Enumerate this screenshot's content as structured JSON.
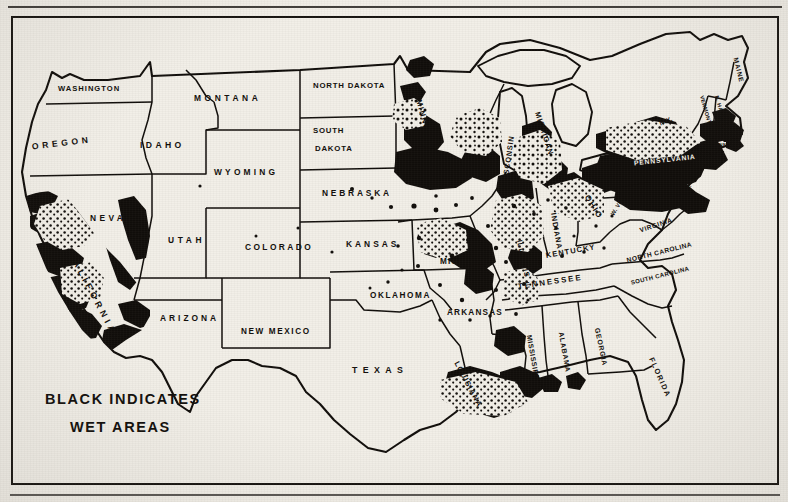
{
  "document": {
    "type": "newspaper-halftone-map",
    "subject": "United States wet areas map",
    "background_color": "#f2efe8",
    "ink_color": "#100d0a"
  },
  "legend": {
    "line1": "BLACK INDICATES",
    "line2": "WET AREAS",
    "meaning": "Black shading marks wet areas"
  },
  "map_data": {
    "type": "choropleth",
    "region": "United States (contiguous 48 states)",
    "shaded_value": "wet",
    "unshaded_value": "dry",
    "shaded_color": "#100d0a",
    "unshaded_color": "#f2efe8",
    "border_color": "#100d0a",
    "states": [
      {
        "name": "WASHINGTON",
        "x": 58,
        "y": 89,
        "size": 7.6,
        "track": 1.0,
        "rot": 0,
        "wet": false
      },
      {
        "name": "OREGON",
        "x": 32,
        "y": 147,
        "size": 8.6,
        "track": 3.6,
        "rot": -7,
        "wet": false
      },
      {
        "name": "IDAHO",
        "x": 140,
        "y": 146,
        "size": 8.6,
        "track": 3.4,
        "rot": 0,
        "wet": false
      },
      {
        "name": "MONTANA",
        "x": 194,
        "y": 98,
        "size": 8.4,
        "track": 3.6,
        "rot": 0,
        "wet": false
      },
      {
        "name": "WYOMING",
        "x": 214,
        "y": 172,
        "size": 8.4,
        "track": 3.2,
        "rot": 0,
        "wet": false
      },
      {
        "name": "NEVADA",
        "x": 90,
        "y": 218,
        "size": 8.4,
        "track": 3.4,
        "rot": 0,
        "wet": true
      },
      {
        "name": "UTAH",
        "x": 168,
        "y": 240,
        "size": 8.4,
        "track": 3.6,
        "rot": 0,
        "wet": false
      },
      {
        "name": "COLORADO",
        "x": 245,
        "y": 247,
        "size": 8.4,
        "track": 2.4,
        "rot": 0,
        "wet": false
      },
      {
        "name": "ARIZONA",
        "x": 160,
        "y": 318,
        "size": 8.4,
        "track": 3.0,
        "rot": 0,
        "wet": false
      },
      {
        "name": "NEW MEXICO",
        "x": 241,
        "y": 332,
        "size": 8.2,
        "track": 1.6,
        "rot": 0,
        "wet": false
      },
      {
        "name": "CALIFORNIA",
        "x": 70,
        "y": 252,
        "size": 8.8,
        "track": 4.0,
        "rot": 62,
        "wet": true
      },
      {
        "name": "NORTH DAKOTA",
        "x": 313,
        "y": 86,
        "size": 7.8,
        "track": 0.8,
        "rot": 0,
        "wet": false
      },
      {
        "name": "SOUTH",
        "x": 313,
        "y": 131,
        "size": 7.8,
        "track": 0.8,
        "rot": 0,
        "wet": false
      },
      {
        "name": "DAKOTA",
        "x": 315,
        "y": 149,
        "size": 7.8,
        "track": 0.8,
        "rot": 0,
        "wet": false
      },
      {
        "name": "NEBRASKA",
        "x": 322,
        "y": 193,
        "size": 8.4,
        "track": 2.8,
        "rot": 0,
        "wet": false
      },
      {
        "name": "KANSAS",
        "x": 346,
        "y": 244,
        "size": 8.4,
        "track": 3.0,
        "rot": 0,
        "wet": false
      },
      {
        "name": "OKLAHOMA",
        "x": 370,
        "y": 296,
        "size": 8.2,
        "track": 1.6,
        "rot": 0,
        "wet": false
      },
      {
        "name": "TEXAS",
        "x": 352,
        "y": 371,
        "size": 8.8,
        "track": 5.4,
        "rot": 0,
        "wet": false
      },
      {
        "name": "MINNESOTA",
        "x": 418,
        "y": 100,
        "size": 7.8,
        "track": 1.4,
        "rot": 74,
        "wet": true
      },
      {
        "name": "IOWA",
        "x": 417,
        "y": 177,
        "size": 8.6,
        "track": 4.2,
        "rot": 0,
        "wet": true
      },
      {
        "name": "MISSOURI",
        "x": 440,
        "y": 262,
        "size": 8.2,
        "track": 1.2,
        "rot": 0,
        "wet": true
      },
      {
        "name": "ARKANSAS",
        "x": 447,
        "y": 313,
        "size": 8.2,
        "track": 1.2,
        "rot": 0,
        "wet": false
      },
      {
        "name": "LOUISIANA",
        "x": 456,
        "y": 362,
        "size": 7.6,
        "track": 1.0,
        "rot": 62,
        "wet": true
      },
      {
        "name": "WISCONSIN",
        "x": 505,
        "y": 185,
        "size": 7.4,
        "track": 0.8,
        "rot": -82,
        "wet": true
      },
      {
        "name": "MICHIGAN",
        "x": 537,
        "y": 112,
        "size": 7.4,
        "track": 1.0,
        "rot": 72,
        "wet": true
      },
      {
        "name": "ILLINOIS",
        "x": 519,
        "y": 240,
        "size": 7.4,
        "track": 0.9,
        "rot": 78,
        "wet": true
      },
      {
        "name": "INDIANA",
        "x": 553,
        "y": 213,
        "size": 7.4,
        "track": 0.9,
        "rot": 80,
        "wet": true
      },
      {
        "name": "OHIO",
        "x": 586,
        "y": 196,
        "size": 8.0,
        "track": 1.6,
        "rot": 58,
        "wet": true
      },
      {
        "name": "KENTUCKY",
        "x": 546,
        "y": 256,
        "size": 7.6,
        "track": 1.0,
        "rot": -10,
        "wet": false
      },
      {
        "name": "TENNESSEE",
        "x": 518,
        "y": 287,
        "size": 7.8,
        "track": 2.0,
        "rot": -8,
        "wet": false
      },
      {
        "name": "MISSISSIPPI",
        "x": 529,
        "y": 335,
        "size": 7.0,
        "track": 0.6,
        "rot": 80,
        "wet": false
      },
      {
        "name": "ALABAMA",
        "x": 561,
        "y": 332,
        "size": 7.0,
        "track": 0.8,
        "rot": 80,
        "wet": false
      },
      {
        "name": "GEORGIA",
        "x": 597,
        "y": 328,
        "size": 7.0,
        "track": 0.8,
        "rot": 78,
        "wet": false
      },
      {
        "name": "FLORIDA",
        "x": 651,
        "y": 358,
        "size": 7.4,
        "track": 1.4,
        "rot": 66,
        "wet": false
      },
      {
        "name": "SOUTH CAROLINA",
        "x": 631,
        "y": 283,
        "size": 6.0,
        "track": 0.4,
        "rot": -14,
        "wet": false
      },
      {
        "name": "NORTH CAROLINA",
        "x": 627,
        "y": 261,
        "size": 6.6,
        "track": 0.5,
        "rot": -14,
        "wet": false
      },
      {
        "name": "VIRGINIA",
        "x": 640,
        "y": 231,
        "size": 6.6,
        "track": 0.6,
        "rot": -18,
        "wet": false
      },
      {
        "name": "W. VIRGINIA",
        "x": 612,
        "y": 215,
        "size": 5.8,
        "track": 0.3,
        "rot": -58,
        "wet": false
      },
      {
        "name": "PENNSYLVANIA",
        "x": 634,
        "y": 163,
        "size": 6.8,
        "track": 0.8,
        "rot": -6,
        "wet": true,
        "reversed": true
      },
      {
        "name": "N.Y.",
        "x": 660,
        "y": 124,
        "size": 6.4,
        "track": 0.4,
        "rot": -22,
        "wet": true
      },
      {
        "name": "MAINE",
        "x": 735,
        "y": 58,
        "size": 6.6,
        "track": 0.8,
        "rot": 76,
        "wet": false
      },
      {
        "name": "VERMONT",
        "x": 701,
        "y": 96,
        "size": 5.4,
        "track": 0.3,
        "rot": 74,
        "wet": false
      },
      {
        "name": "N. HAMP.",
        "x": 716,
        "y": 96,
        "size": 5.4,
        "track": 0.3,
        "rot": 74,
        "wet": false
      },
      {
        "name": "MASS.",
        "x": 723,
        "y": 130,
        "size": 5.4,
        "track": 0.3,
        "rot": 0,
        "wet": true
      },
      {
        "name": "CONN.",
        "x": 711,
        "y": 146,
        "size": 5.0,
        "track": 0.3,
        "rot": 0,
        "wet": true
      },
      {
        "name": "N.J.",
        "x": 695,
        "y": 168,
        "size": 5.6,
        "track": 0.3,
        "rot": 0,
        "wet": true
      },
      {
        "name": "MD.",
        "x": 681,
        "y": 186,
        "size": 5.4,
        "track": 0.3,
        "rot": 0,
        "wet": true
      }
    ],
    "wet_regions": [
      {
        "label": "San Francisco Bay / Sacramento",
        "state": "CALIFORNIA"
      },
      {
        "label": "Los Angeles",
        "state": "CALIFORNIA"
      },
      {
        "label": "Twin Cities",
        "state": "MINNESOTA"
      },
      {
        "label": "Chicago / Milwaukee",
        "state": "ILLINOIS"
      },
      {
        "label": "Detroit",
        "state": "MICHIGAN"
      },
      {
        "label": "St. Louis",
        "state": "MISSOURI"
      },
      {
        "label": "New Orleans",
        "state": "LOUISIANA"
      },
      {
        "label": "New York / Philadelphia / Pittsburgh",
        "state": "PENNSYLVANIA"
      },
      {
        "label": "Boston",
        "state": "MASS."
      }
    ],
    "great_lakes": [
      "Superior",
      "Michigan",
      "Huron",
      "Erie",
      "Ontario"
    ]
  }
}
